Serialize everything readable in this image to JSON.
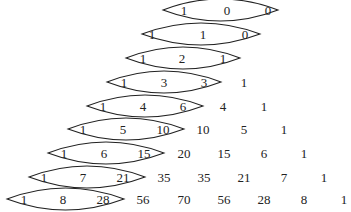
{
  "diagram": {
    "type": "pascal-triangle-lenses",
    "rows": [
      {
        "values": [
          "1",
          "0",
          "0"
        ],
        "y": 14,
        "xs": [
          184,
          227,
          268
        ],
        "lens": [
          163,
          278
        ]
      },
      {
        "values": [
          "1",
          "1",
          "0"
        ],
        "y": 38,
        "xs": [
          152,
          203,
          245
        ],
        "lens": [
          142,
          260
        ]
      },
      {
        "values": [
          "1",
          "2",
          "1"
        ],
        "y": 62,
        "xs": [
          143,
          182,
          223
        ],
        "lens": [
          126,
          240
        ]
      },
      {
        "values": [
          "1",
          "3",
          "3",
          "1"
        ],
        "y": 86,
        "xs": [
          124,
          164,
          204,
          244
        ],
        "lens": [
          107,
          221
        ]
      },
      {
        "values": [
          "1",
          "4",
          "6",
          "4",
          "1"
        ],
        "y": 110,
        "xs": [
          103,
          143,
          183,
          223,
          264
        ],
        "lens": [
          87,
          203
        ]
      },
      {
        "values": [
          "1",
          "5",
          "10",
          "10",
          "5",
          "1"
        ],
        "y": 133,
        "xs": [
          83,
          123,
          163,
          203,
          244,
          284
        ],
        "lens": [
          68,
          184
        ]
      },
      {
        "values": [
          "1",
          "6",
          "15",
          "20",
          "15",
          "6",
          "1"
        ],
        "y": 157,
        "xs": [
          64,
          104,
          144,
          184,
          224,
          264,
          304
        ],
        "lens": [
          48,
          164
        ]
      },
      {
        "values": [
          "1",
          "7",
          "21",
          "35",
          "35",
          "21",
          "7",
          "1"
        ],
        "y": 181,
        "xs": [
          44,
          83,
          123,
          164,
          204,
          244,
          284,
          324
        ],
        "lens": [
          29,
          145
        ]
      },
      {
        "values": [
          "1",
          "8",
          "28",
          "56",
          "70",
          "56",
          "28",
          "8",
          "1"
        ],
        "y": 203,
        "xs": [
          24,
          63,
          103,
          143,
          184,
          224,
          264,
          304,
          344
        ],
        "lens": [
          7,
          124
        ]
      }
    ]
  }
}
